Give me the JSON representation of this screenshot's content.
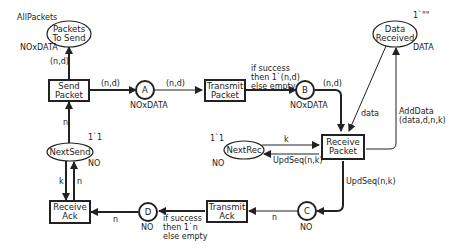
{
  "places": {
    "packets_to_send": {
      "label": [
        "Packets",
        "To Send"
      ],
      "colorset": "NOxDATA",
      "marking": "AllPackets"
    },
    "A": {
      "label": "A",
      "colorset": "NOxDATA"
    },
    "B": {
      "label": "B",
      "colorset": "NOxDATA"
    },
    "C": {
      "label": "C",
      "colorset": "NO"
    },
    "D": {
      "label": "D",
      "colorset": "NO"
    },
    "next_send": {
      "label": "NextSend",
      "colorset": "NO",
      "marking": "1`1"
    },
    "next_rec": {
      "label": "NextRec",
      "colorset": "NO",
      "marking": "1`1"
    },
    "data_received": {
      "label": [
        "Data",
        "Received"
      ],
      "colorset": "DATA",
      "marking": "1`\"\""
    }
  },
  "transitions": {
    "send_packet": [
      "Send",
      "Packet"
    ],
    "transmit_packet": [
      "Transmit",
      "Packet"
    ],
    "receive_packet": [
      "Receive",
      "Packet"
    ],
    "transmit_ack": [
      "Transmit",
      "Ack"
    ],
    "receive_ack": [
      "Receive",
      "Ack"
    ]
  },
  "arcs": {
    "send_to_packets": "(n,d)",
    "send_to_A": "(n,d)",
    "A_to_transmit": "(n,d)",
    "transmit_to_B": [
      "if success",
      "then 1`(n,d)",
      "else empty"
    ],
    "B_to_receive": "(n,d)",
    "send_nextsend": "n",
    "datarec_to_receive": "data",
    "receive_to_datarec": [
      "AddData",
      "(data,d,n,k)"
    ],
    "nextrec_to_receive": "k",
    "receive_to_nextrec": "UpdSeq(n,k)",
    "receive_to_C": "UpdSeq(n,k)",
    "C_to_transmitack": "n",
    "transmitack_to_D": [
      "if success",
      "then 1`n",
      "else empty"
    ],
    "D_to_receiveack": "n",
    "nextsend_to_receiveack": "k",
    "receiveack_to_nextsend": "n"
  }
}
